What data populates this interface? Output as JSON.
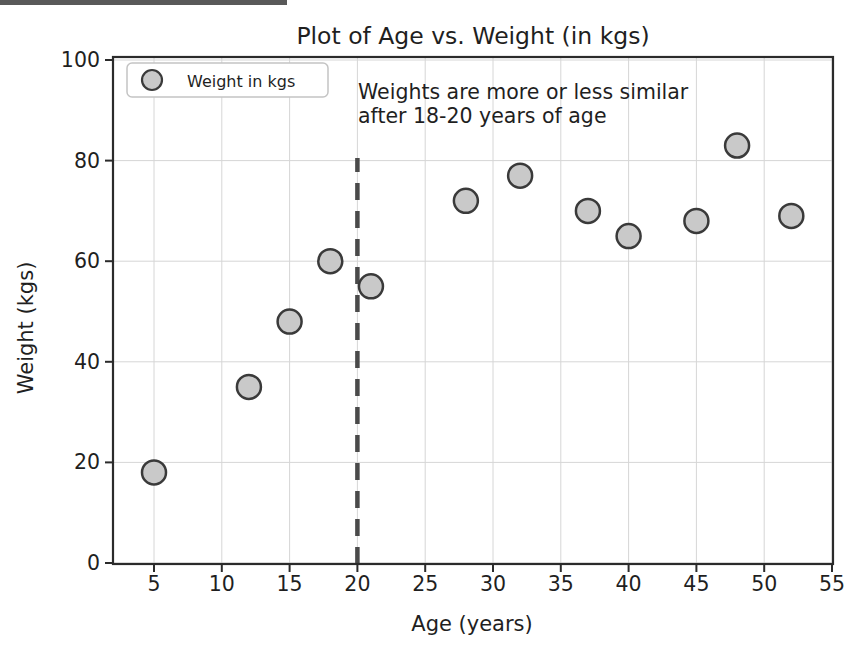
{
  "chart_data": {
    "type": "scatter",
    "title": "Plot of Age vs. Weight (in kgs)",
    "xlabel": "Age (years)",
    "ylabel": "Weight (kgs)",
    "series": [
      {
        "name": "Weight in kgs",
        "x": [
          5,
          12,
          15,
          18,
          21,
          28,
          32,
          37,
          40,
          45,
          48,
          52
        ],
        "y": [
          18,
          35,
          48,
          60,
          55,
          72,
          77,
          70,
          65,
          68,
          83,
          69
        ]
      }
    ],
    "x_ticks": [
      5,
      10,
      15,
      20,
      25,
      30,
      35,
      40,
      45,
      50,
      55
    ],
    "y_ticks": [
      0,
      20,
      40,
      60,
      80,
      100
    ],
    "xlim": [
      2,
      55.2
    ],
    "ylim": [
      0,
      100
    ],
    "grid": true,
    "legend_position": "upper left",
    "legend_label": "Weight in kgs",
    "vline_x": 20,
    "annotation": {
      "line1": "Weights are more or less similar",
      "line2": "after 18-20 years of age"
    }
  },
  "colors": {
    "marker_fill": "#c9c9c9",
    "marker_edge": "#3a3a3a",
    "grid": "#d6d6d6",
    "spine": "#2b2b2b",
    "dashed_line": "#4a4a4a",
    "text": "#1f1f1f",
    "legend_border": "#c4c4c4",
    "scan_artifact": "#3c3c3c"
  }
}
